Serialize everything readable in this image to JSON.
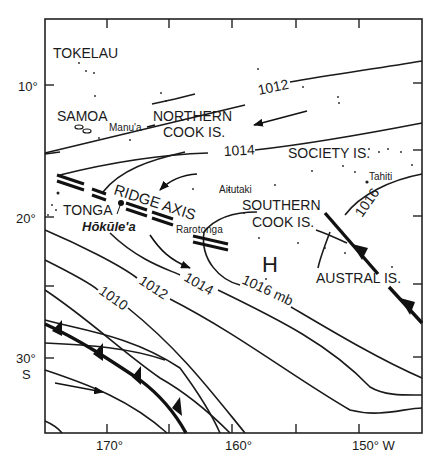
{
  "map": {
    "title": "Surface pressure chart, South Pacific",
    "axes": {
      "lat_ticks": [
        {
          "label": "10°"
        },
        {
          "label": "20°"
        },
        {
          "label": "30°",
          "sublabel": "S"
        }
      ],
      "lon_ticks": [
        {
          "label": "170°"
        },
        {
          "label": "160°"
        },
        {
          "label": "150° W"
        }
      ]
    },
    "regions": {
      "tokelau": "TOKELAU",
      "samoa": "SAMOA",
      "manua": "Manu'a",
      "northern_cook_1": "NORTHERN",
      "northern_cook_2": "COOK IS.",
      "society": "SOCIETY IS.",
      "tahiti": "Tahiti",
      "aitutaki": "Aitutaki",
      "southern_cook_1": "SOUTHERN",
      "southern_cook_2": "COOK IS.",
      "tonga": "TONGA",
      "hokulea": "Hōkūle'a",
      "rarotonga": "Rarotonga",
      "austral": "AUSTRAL IS."
    },
    "features": {
      "ridge_axis": "RIDGE AXIS",
      "high_marker": "H"
    },
    "isobars": {
      "i1012_top": "1012",
      "i1014_top": "1014",
      "i1016_right": "1016",
      "i1016_mb": "1016 mb",
      "i1014_low": "1014",
      "i1012_low": "1012",
      "i1010": "1010"
    }
  }
}
